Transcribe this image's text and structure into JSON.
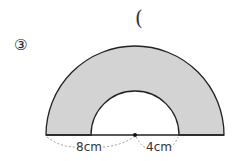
{
  "problem": {
    "number": "③",
    "answer_paren": "("
  },
  "figure": {
    "type": "semicircular-annulus",
    "fill_color": "#d3d3d3",
    "stroke_color": "#222222",
    "labels": {
      "outer_segment": "8cm",
      "inner_radius": "4cm"
    }
  }
}
